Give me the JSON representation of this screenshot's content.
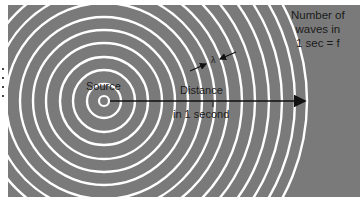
{
  "figure": {
    "background_color": "#7a7a7a",
    "ring_color": "#ffffff",
    "arrow_color": "#111111",
    "source": {
      "label": "Source",
      "cx": 104,
      "cy": 101
    },
    "rings": {
      "count": 16,
      "radii": [
        5,
        17,
        31,
        44,
        58,
        71,
        84,
        98,
        111,
        124,
        138,
        151,
        165,
        178,
        191,
        203
      ]
    },
    "arrow": {
      "x1": 110,
      "y1": 101,
      "x2": 305,
      "y2": 101
    },
    "distance_label": {
      "line1": "Distance",
      "line2": "in 1 second"
    },
    "wavelength_label": "λ",
    "waves_label": {
      "line1": "Number of",
      "line2": "waves in",
      "line3": "1 sec = f"
    }
  }
}
